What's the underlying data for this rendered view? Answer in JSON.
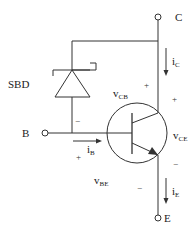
{
  "diagram": {
    "terminals": {
      "collector": "C",
      "base": "B",
      "emitter": "E"
    },
    "components": {
      "diode_label": "SBD"
    },
    "currents": {
      "ic": {
        "main": "i",
        "sub": "C"
      },
      "ib": {
        "main": "i",
        "sub": "B"
      },
      "ie": {
        "main": "i",
        "sub": "E"
      }
    },
    "voltages": {
      "vcb": {
        "main": "v",
        "sub": "CB"
      },
      "vce": {
        "main": "v",
        "sub": "CE"
      },
      "vbe": {
        "main": "v",
        "sub": "BE"
      }
    },
    "signs": {
      "plus": "+",
      "minus": "−"
    },
    "colors": {
      "line": "#333333",
      "background": "#ffffff"
    }
  }
}
